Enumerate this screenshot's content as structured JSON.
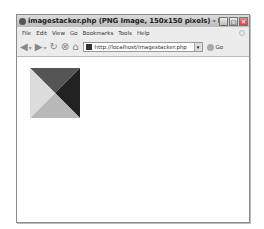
{
  "window": {
    "title": "imagestacker.php (PNG Image, 150x150 pixels) - Mozilla Firefox",
    "controls": {
      "minimize": "_",
      "maximize": "□",
      "close": "✕"
    }
  },
  "menubar": {
    "items": [
      {
        "label": "File"
      },
      {
        "label": "Edit"
      },
      {
        "label": "View"
      },
      {
        "label": "Go"
      },
      {
        "label": "Bookmarks"
      },
      {
        "label": "Tools"
      },
      {
        "label": "Help"
      }
    ]
  },
  "toolbar": {
    "back_icon": "◀",
    "forward_icon": "▶",
    "dropdown_icon": "▾",
    "reload_icon": "↻",
    "stop_icon": "⊗",
    "home_icon": "⌂",
    "url": "http://localhost/imagestacker.php",
    "go_label": "Go"
  },
  "content": {
    "image": {
      "triangles": {
        "top": "#555555",
        "right": "#222222",
        "bottom": "#b8b8b8",
        "left": "#dcdcdc"
      }
    }
  }
}
